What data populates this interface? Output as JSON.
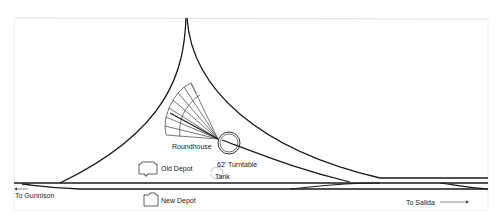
{
  "diagram": {
    "type": "railroad track layout",
    "labels": {
      "roundhouse": "Roundhouse",
      "turntable": "62' Turntable",
      "old_depot": "Old Depot",
      "tank": "Tank",
      "new_depot": "New Depot",
      "to_gunnison": "To Gunnison",
      "to_salida": "To Salida"
    },
    "colors": {
      "track": "#1a1a1a",
      "frame": "#e6e6e6",
      "roundhouse_lines": "#555555"
    }
  }
}
